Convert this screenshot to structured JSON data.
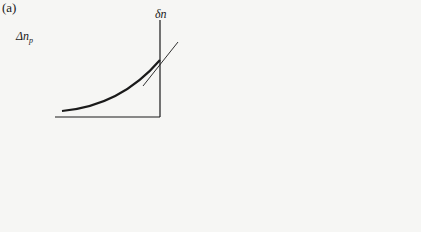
{
  "figure": {
    "panel_label": "(a)",
    "left_plot": {
      "y_axis_label": "δn",
      "x_axis_label": "x_p",
      "x_origin_label": "0",
      "point_label": "Δn_p",
      "slope_label": "Slope"
    },
    "right_plot": {
      "y_axis_label": "δp",
      "x_axis_label": "x_n",
      "x_origin_label": "0",
      "point_label": "Δp_n"
    },
    "currents": {
      "right_arrow_label": "I_p (x_n = 0)",
      "left_arrow_label": "I_n (x_p = 0)"
    }
  },
  "equations": {
    "left": {
      "line1_lhs": "I_n(x_p=0) = qAD_n",
      "line1_num": "dδn",
      "line1_den": "dx_p",
      "line1_eval": "x_p=0",
      "line2": "= −qA (D_n / L_n) Δn_p"
    },
    "right": {
      "line1_lhs": "I_p(x_n=0) = −qAD_p",
      "line1_num": "dδp",
      "line1_den": "dx_n",
      "line1_eval": "x_n=0",
      "line2": "= qA (D_p / L_p) Δp_n"
    }
  },
  "colors": {
    "ink": "#1a1a1a",
    "background": "#f6f6f4"
  }
}
